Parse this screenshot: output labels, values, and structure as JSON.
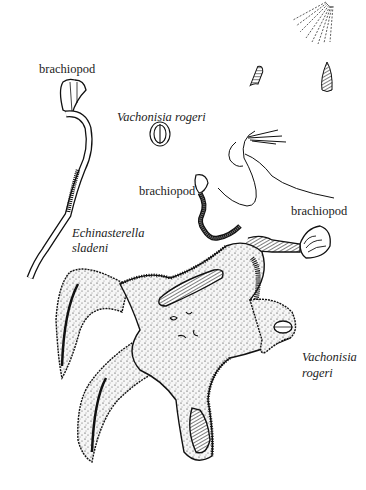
{
  "figure": {
    "background": "#ffffff",
    "ink": "#111111",
    "labels": {
      "brachiopod_top_left": "brachiopod",
      "vachonisia_top": "Vachonisia rogeri",
      "brachiopod_middle": "brachiopod",
      "brachiopod_right": "brachiopod",
      "echinasterella_line1": "Echinasterella",
      "echinasterella_line2": "sladeni",
      "vachonisia_bottom_line1": "Vachonisia",
      "vachonisia_bottom_line2": "rogeri"
    }
  }
}
